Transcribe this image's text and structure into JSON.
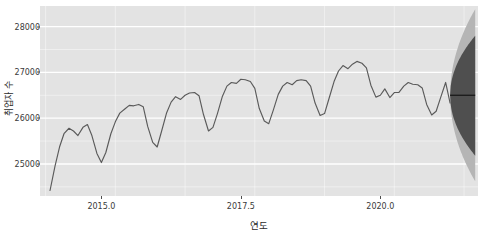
{
  "chart_data": {
    "type": "line",
    "title": "",
    "xlabel": "연도",
    "ylabel": "취업자 수",
    "xlim": [
      2013.9,
      2021.75
    ],
    "ylim": [
      24300,
      28450
    ],
    "grid": true,
    "legend": null,
    "y_ticks": [
      25000,
      26000,
      27000,
      28000
    ],
    "y_tick_labels": [
      "25000",
      "26000",
      "27000",
      "28000"
    ],
    "x_ticks": [
      2015.0,
      2017.5,
      2020.0
    ],
    "x_tick_labels": [
      "2015.0",
      "2017.5",
      "2020.0"
    ],
    "colors": {
      "panel_background": "#e3e3e3",
      "gridline": "#ffffff",
      "line": "#5a5a5a",
      "forecast_outer_band": "#b5b5b5",
      "forecast_inner_band": "#4f4f4f",
      "forecast_median": "#1a1a1a",
      "text": "#3a3a3a"
    },
    "series": [
      {
        "name": "취업자 수",
        "kind": "observed-line",
        "x": [
          2014.08,
          2014.17,
          2014.25,
          2014.33,
          2014.42,
          2014.5,
          2014.58,
          2014.67,
          2014.75,
          2014.83,
          2014.92,
          2015.0,
          2015.08,
          2015.17,
          2015.25,
          2015.33,
          2015.42,
          2015.5,
          2015.58,
          2015.67,
          2015.75,
          2015.83,
          2015.92,
          2016.0,
          2016.08,
          2016.17,
          2016.25,
          2016.33,
          2016.42,
          2016.5,
          2016.58,
          2016.67,
          2016.75,
          2016.83,
          2016.92,
          2017.0,
          2017.08,
          2017.17,
          2017.25,
          2017.33,
          2017.42,
          2017.5,
          2017.58,
          2017.67,
          2017.75,
          2017.83,
          2017.92,
          2018.0,
          2018.08,
          2018.17,
          2018.25,
          2018.33,
          2018.42,
          2018.5,
          2018.58,
          2018.67,
          2018.75,
          2018.83,
          2018.92,
          2019.0,
          2019.08,
          2019.17,
          2019.25,
          2019.33,
          2019.42,
          2019.5,
          2019.58,
          2019.67,
          2019.75,
          2019.83,
          2019.92,
          2020.0,
          2020.08,
          2020.17,
          2020.25,
          2020.33,
          2020.42,
          2020.5,
          2020.58,
          2020.67,
          2020.75,
          2020.83,
          2020.92,
          2021.0,
          2021.08,
          2021.17,
          2021.25
        ],
        "y": [
          24420,
          24960,
          25370,
          25660,
          25780,
          25720,
          25620,
          25800,
          25860,
          25620,
          25230,
          25030,
          25250,
          25660,
          25920,
          26110,
          26200,
          26280,
          26270,
          26300,
          26250,
          25820,
          25470,
          25370,
          25720,
          26120,
          26350,
          26470,
          26410,
          26500,
          26550,
          26560,
          26490,
          26080,
          25720,
          25800,
          26100,
          26480,
          26700,
          26780,
          26760,
          26850,
          26840,
          26800,
          26650,
          26210,
          25940,
          25880,
          26170,
          26520,
          26700,
          26780,
          26730,
          26820,
          26840,
          26820,
          26700,
          26330,
          26060,
          26100,
          26430,
          26800,
          27030,
          27150,
          27080,
          27180,
          27240,
          27200,
          27100,
          26720,
          26460,
          26500,
          26640,
          26450,
          26560,
          26560,
          26700,
          26780,
          26740,
          26730,
          26660,
          26300,
          26070,
          26150,
          26450,
          26780,
          26330
        ]
      }
    ],
    "forecast": {
      "kind": "fan-interval",
      "x_start": 2021.25,
      "x_end": 2021.7,
      "median": 26500,
      "outer_interval_label": "95%",
      "inner_interval_label": "80%",
      "outer_upper_end": 28380,
      "outer_lower_end": 24620,
      "inner_upper_end": 27800,
      "inner_lower_end": 25180
    }
  }
}
